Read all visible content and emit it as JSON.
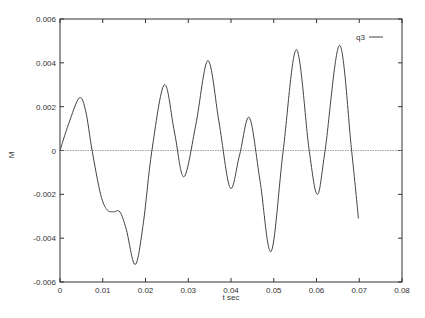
{
  "chart_data": {
    "type": "line",
    "title": "",
    "xlabel": "t sec",
    "ylabel": "M",
    "xlim": [
      0,
      0.08
    ],
    "ylim": [
      -0.006,
      0.006
    ],
    "xticks": [
      "0",
      "0.01",
      "0.02",
      "0.03",
      "0.04",
      "0.05",
      "0.06",
      "0.07",
      "0.08"
    ],
    "yticks": [
      "0.006",
      "0.004",
      "0.002",
      "0",
      "-0.002",
      "-0.004",
      "-0.006"
    ],
    "grid": false,
    "zero_line": true,
    "legend": {
      "position": "top-right",
      "entries": [
        "q3"
      ]
    },
    "series": [
      {
        "name": "q3",
        "x": [
          0,
          0.002,
          0.0045,
          0.006,
          0.0075,
          0.0095,
          0.011,
          0.0125,
          0.014,
          0.0155,
          0.0176,
          0.0195,
          0.0215,
          0.0244,
          0.0268,
          0.029,
          0.0318,
          0.0346,
          0.0372,
          0.0398,
          0.042,
          0.0443,
          0.0468,
          0.0494,
          0.0522,
          0.0553,
          0.0583,
          0.0602,
          0.062,
          0.0654,
          0.0682,
          0.0698
        ],
        "values": [
          0,
          0.0012,
          0.0024,
          0.0018,
          0,
          -0.002,
          -0.0027,
          -0.0028,
          -0.0028,
          -0.0036,
          -0.0052,
          -0.0033,
          0,
          0.003,
          0.0008,
          -0.0012,
          0.0012,
          0.0041,
          0.0013,
          -0.0017,
          -0.0002,
          0.0015,
          -0.0014,
          -0.0046,
          0,
          0.0046,
          0,
          -0.002,
          0,
          0.0048,
          0,
          -0.0031
        ]
      }
    ]
  }
}
